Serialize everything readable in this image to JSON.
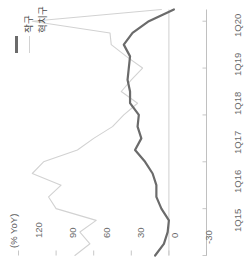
{
  "chart_data": {
    "type": "line",
    "title": "",
    "subtitle": "",
    "unit_label": "(% YoY)",
    "xlabel": "",
    "ylabel": "",
    "grid": false,
    "orientation": "rotated-90-ccw",
    "legend_position": "top-left",
    "ylim": [
      -30,
      120
    ],
    "yticks": [
      120,
      90,
      60,
      30,
      0,
      -30
    ],
    "ytick_labels": [
      "120",
      "90",
      "60",
      "30",
      "0",
      "-30"
    ],
    "xticks": [
      "1Q15",
      "1Q16",
      "1Q17",
      "1Q18",
      "1Q19",
      "1Q20"
    ],
    "x": [
      "1Q15",
      "2Q15",
      "3Q15",
      "4Q15",
      "1Q16",
      "2Q16",
      "3Q16",
      "4Q16",
      "1Q17",
      "2Q17",
      "3Q17",
      "4Q17",
      "1Q18",
      "2Q18",
      "3Q18",
      "4Q18",
      "1Q19",
      "2Q19",
      "3Q19",
      "4Q19",
      "1Q20",
      "2Q20"
    ],
    "series": [
      {
        "name": "작구",
        "color": "#6b6b6b",
        "width": 2.2,
        "values": [
          11,
          4,
          1,
          0,
          6,
          10,
          10,
          13,
          19,
          27,
          22,
          25,
          24,
          31,
          31,
          33,
          32,
          31,
          36,
          29,
          16,
          -4
        ]
      },
      {
        "name": "혁치구",
        "color": "#d2d2d2",
        "width": 1.1,
        "values": [
          75,
          63,
          71,
          58,
          90,
          96,
          86,
          109,
          100,
          73,
          60,
          45,
          36,
          25,
          38,
          30,
          21,
          34,
          46,
          47,
          109,
          6
        ]
      }
    ],
    "legend": [
      {
        "label": "작구",
        "color": "#6b6b6b",
        "style": "thick-line"
      },
      {
        "label": "혁치구",
        "color": "#d2d2d2",
        "style": "thin-line"
      }
    ],
    "axis_color": "#b9b9b9",
    "zero_line_color": "#c9c9c9"
  },
  "axis": {
    "unit_label": "(% YoY)",
    "ytick_0": "120",
    "ytick_1": "90",
    "ytick_2": "60",
    "ytick_3": "30",
    "ytick_4": "0",
    "ytick_5": "-30",
    "xtick_0": "1Q15",
    "xtick_1": "1Q16",
    "xtick_2": "1Q17",
    "xtick_3": "1Q18",
    "xtick_4": "1Q19",
    "xtick_5": "1Q20"
  },
  "legend": {
    "item_0_label": "작구",
    "item_1_label": "혁치구"
  }
}
